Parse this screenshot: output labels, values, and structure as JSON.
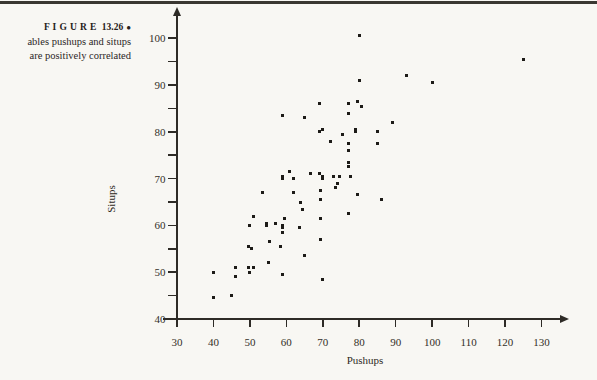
{
  "caption": {
    "figure_label": "F I G U R E",
    "figure_number": "13.26",
    "bullet": "●",
    "line2": "ables pushups and situps",
    "line3": "are positively correlated"
  },
  "colors": {
    "paper": "#f8f7f3",
    "ink": "#2e2b26",
    "marker": "#1d1b17",
    "rule": "#3a3731"
  },
  "chart_data": {
    "type": "scatter",
    "title": "",
    "xlabel": "Pushups",
    "ylabel": "Situps",
    "xlim": [
      30,
      138
    ],
    "ylim": [
      40,
      106
    ],
    "x_ticks": [
      30,
      40,
      50,
      60,
      70,
      80,
      90,
      100,
      110,
      120,
      130
    ],
    "y_major_ticks": [
      40,
      50,
      60,
      70,
      80,
      90,
      100
    ],
    "y_minor_ticks": [
      45,
      55,
      65,
      75,
      85,
      95
    ],
    "grid": "off",
    "legend": "none",
    "marker": "small-black-square",
    "points": [
      [
        80,
        100.5
      ],
      [
        125,
        95.5
      ],
      [
        93,
        92
      ],
      [
        80,
        91
      ],
      [
        100,
        90.5
      ],
      [
        79.5,
        86.5
      ],
      [
        69,
        86
      ],
      [
        77,
        86
      ],
      [
        80.5,
        85.5
      ],
      [
        77,
        84
      ],
      [
        59,
        83.5
      ],
      [
        65,
        83
      ],
      [
        89,
        82
      ],
      [
        70,
        80.5
      ],
      [
        79,
        80.5
      ],
      [
        69,
        80
      ],
      [
        79,
        80
      ],
      [
        85,
        80
      ],
      [
        75.5,
        79.5
      ],
      [
        72,
        78
      ],
      [
        85,
        77.5
      ],
      [
        77,
        77.5
      ],
      [
        77,
        76
      ],
      [
        77,
        73.5
      ],
      [
        77,
        72.5
      ],
      [
        61,
        71.5
      ],
      [
        66.5,
        71
      ],
      [
        69,
        71
      ],
      [
        59,
        70.5
      ],
      [
        70,
        70.5
      ],
      [
        73,
        70.5
      ],
      [
        74.5,
        70.5
      ],
      [
        77.5,
        70.5
      ],
      [
        59,
        70
      ],
      [
        62,
        70
      ],
      [
        70,
        70
      ],
      [
        74,
        69
      ],
      [
        73.5,
        68
      ],
      [
        69.5,
        67.5
      ],
      [
        53.5,
        67
      ],
      [
        62,
        67
      ],
      [
        79.5,
        66.5
      ],
      [
        69.5,
        65.5
      ],
      [
        86,
        65.5
      ],
      [
        64,
        65
      ],
      [
        64.5,
        63.5
      ],
      [
        77,
        62.5
      ],
      [
        51,
        62
      ],
      [
        59.5,
        61.5
      ],
      [
        69.5,
        61.5
      ],
      [
        54.5,
        60.5
      ],
      [
        57,
        60.5
      ],
      [
        50,
        60
      ],
      [
        54.5,
        60
      ],
      [
        59,
        60
      ],
      [
        59,
        59.5
      ],
      [
        63.5,
        59.5
      ],
      [
        59,
        58.5
      ],
      [
        69.5,
        57
      ],
      [
        55.5,
        56.5
      ],
      [
        49.5,
        55.5
      ],
      [
        58.5,
        55.5
      ],
      [
        50.5,
        55
      ],
      [
        65,
        53.5
      ],
      [
        55,
        52
      ],
      [
        46,
        51
      ],
      [
        49.5,
        51
      ],
      [
        51,
        51
      ],
      [
        40,
        50
      ],
      [
        50,
        50
      ],
      [
        59,
        49.5
      ],
      [
        46,
        49
      ],
      [
        70,
        48.5
      ],
      [
        45,
        45
      ],
      [
        40,
        44.5
      ]
    ]
  }
}
